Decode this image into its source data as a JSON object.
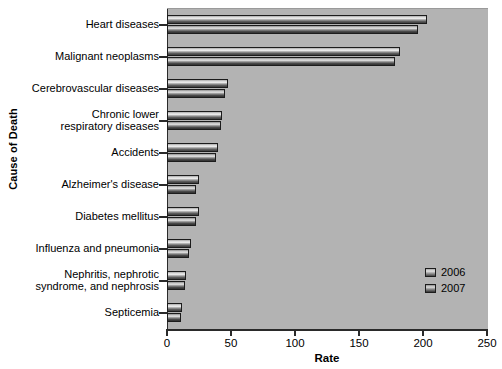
{
  "chart_data": {
    "type": "bar",
    "orientation": "horizontal",
    "title": "",
    "xlabel": "Rate",
    "ylabel": "Cause of Death",
    "xlim": [
      0,
      250
    ],
    "xticks": [
      0,
      50,
      100,
      150,
      200,
      250
    ],
    "xticklabels": [
      "0",
      "50",
      "100",
      "150",
      "200",
      "250"
    ],
    "grid": false,
    "legend_position": "lower right",
    "categories": [
      "Heart diseases",
      "Malignant neoplasms",
      "Cerebrovascular diseases",
      "Chronic lower\nrespiratory diseases",
      "Accidents",
      "Alzheimer's disease",
      "Diabetes mellitus",
      "Influenza and pneumonia",
      "Nephritis, nephrotic\nsyndrome, and nephrosis",
      "Septicemia"
    ],
    "series": [
      {
        "name": "2006",
        "color": "#d8d8d8",
        "values": [
          203,
          182,
          48,
          43,
          40,
          25,
          25,
          19,
          15,
          12
        ]
      },
      {
        "name": "2007",
        "color": "#9a9a9a",
        "values": [
          196,
          178,
          45,
          42,
          38,
          23,
          23,
          17,
          14,
          11
        ]
      }
    ]
  },
  "legend": {
    "entries": [
      {
        "label": "2006"
      },
      {
        "label": "2007"
      }
    ]
  },
  "axes": {
    "x_title": "Rate",
    "y_title": "Cause of Death"
  }
}
